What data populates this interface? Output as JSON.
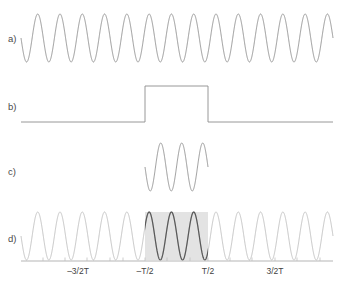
{
  "figure": {
    "kind": "waveform-panels",
    "background_color": "#ffffff",
    "panels": [
      {
        "id": "a",
        "label": "a)",
        "label_x": 8,
        "label_y": 42,
        "description": "continuous-sinusoid",
        "wave": {
          "x_start": 21,
          "x_end": 333,
          "baseline_y": 38,
          "amplitude": 24,
          "cycles": 14,
          "phase_deg": 180,
          "stroke": "#8c8c8c",
          "stroke_width": 0.9
        }
      },
      {
        "id": "b",
        "label": "b)",
        "label_x": 8,
        "label_y": 110,
        "description": "rectangular-window-pulse",
        "pulse": {
          "x_start": 21,
          "x_end": 333,
          "low_y": 122,
          "high_y": 86,
          "rise_x": 145,
          "fall_x": 208,
          "stroke": "#8c8c8c",
          "stroke_width": 0.9
        }
      },
      {
        "id": "c",
        "label": "c)",
        "label_x": 8,
        "label_y": 175,
        "description": "windowed-sinusoid-product",
        "wave": {
          "x_start": 145,
          "x_end": 208,
          "baseline_y": 167,
          "amplitude": 24,
          "cycles": 3,
          "phase_deg": 180,
          "stroke": "#8c8c8c",
          "stroke_width": 0.9
        }
      },
      {
        "id": "d",
        "label": "d)",
        "label_x": 8,
        "label_y": 242,
        "description": "sinusoid-with-highlighted-window",
        "wave": {
          "x_start": 21,
          "x_end": 333,
          "baseline_y": 236,
          "amplitude": 24,
          "cycles": 14,
          "phase_deg": 180,
          "stroke": "#bdbdbd",
          "stroke_highlight": "#5a5a5a",
          "stroke_width": 0.9
        },
        "shaded_window": {
          "x_start": 145,
          "x_end": 208,
          "y_top": 212,
          "y_bottom": 260,
          "fill": "#e3e3e3"
        },
        "axis": {
          "x_start": 21,
          "x_end": 333,
          "y": 261,
          "stroke": "#b5b5b5",
          "stroke_width": 1.1,
          "tick_height": 3.5,
          "tick_stroke": "#c0c0c0",
          "tick_positions": [
            43,
            65,
            87,
            110,
            123,
            145,
            167,
            190,
            208,
            230,
            252,
            275,
            297,
            320
          ],
          "labels": [
            {
              "text": "–3/2T",
              "x": 78,
              "y": 274
            },
            {
              "text": "–T/2",
              "x": 145,
              "y": 274
            },
            {
              "text": "T/2",
              "x": 208,
              "y": 274
            },
            {
              "text": "3/2T",
              "x": 275,
              "y": 274
            }
          ]
        }
      }
    ]
  },
  "chart_data": {
    "type": "line",
    "title": "",
    "subtitle": "",
    "xlabel": "",
    "ylabel": "",
    "grid": false,
    "legend": "none",
    "panel_count": 4,
    "panel_labels": [
      "a)",
      "b)",
      "c)",
      "d)"
    ],
    "xtick_labels": [
      "–3/2T",
      "–T/2",
      "T/2",
      "3/2T"
    ],
    "xtick_values": [
      -1.5,
      -0.5,
      0.5,
      1.5
    ],
    "xlim": [
      -3.3,
      3.3
    ],
    "series": [
      {
        "name": "a) continuous sinusoid",
        "panel": "a",
        "type": "line",
        "waveform": "sine",
        "cycles_visible": 14,
        "amplitude": 1,
        "offset": 0,
        "x_range": [
          -3.3,
          3.3
        ],
        "ylim": [
          -1.2,
          1.2
        ],
        "color": "#8c8c8c"
      },
      {
        "name": "b) rectangular window",
        "panel": "b",
        "type": "step",
        "waveform": "rect",
        "amplitude": 1,
        "low_value": 0,
        "high_value": 1,
        "window_start": -0.5,
        "window_end": 0.5,
        "x_range": [
          -3.3,
          3.3
        ],
        "ylim": [
          -0.2,
          1.4
        ],
        "color": "#8c8c8c"
      },
      {
        "name": "c) truncated sinusoid (product)",
        "panel": "c",
        "type": "line",
        "waveform": "sine-windowed",
        "cycles_visible": 3,
        "amplitude": 1,
        "x_range": [
          -0.5,
          0.5
        ],
        "ylim": [
          -1.2,
          1.2
        ],
        "color": "#8c8c8c"
      },
      {
        "name": "d) sinusoid with window highlighted",
        "panel": "d",
        "type": "line",
        "waveform": "sine",
        "cycles_visible": 14,
        "amplitude": 1,
        "x_range": [
          -3.3,
          3.3
        ],
        "ylim": [
          -1.2,
          1.2
        ],
        "color": "#bdbdbd",
        "highlight_color": "#5a5a5a",
        "highlight_x_range": [
          -0.5,
          0.5
        ],
        "shade_color": "#e3e3e3"
      }
    ]
  }
}
